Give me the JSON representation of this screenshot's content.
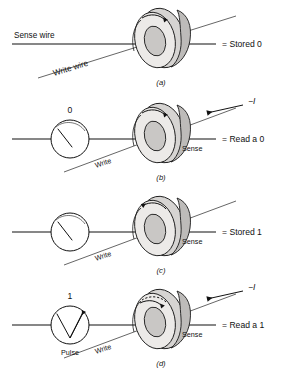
{
  "figure": {
    "background_color": "#ffffff",
    "line_color": "#111111",
    "core_fill": "#d6d4d2",
    "core_shadow": "#bdbbb9"
  },
  "panels": [
    {
      "id": "a",
      "caption": "(a)",
      "result_label": "= Stored 0",
      "sense_wire_label": "Sense wire",
      "write_wire_label": "Write wire",
      "sense_label": "",
      "write_label": "",
      "current_label": "",
      "gauge": null,
      "flux_direction": "clockwise"
    },
    {
      "id": "b",
      "caption": "(b)",
      "result_label": "= Read a 0",
      "sense_wire_label": "",
      "write_wire_label": "",
      "sense_label": "Sense",
      "write_label": "Write",
      "current_label": "−I",
      "gauge": {
        "value_label": "0",
        "bottom_label": "",
        "needle": "flat"
      },
      "flux_direction": "clockwise"
    },
    {
      "id": "c",
      "caption": "(c)",
      "result_label": "= Stored 1",
      "sense_wire_label": "",
      "write_wire_label": "",
      "sense_label": "Sense",
      "write_label": "Write",
      "current_label": "",
      "gauge": {
        "value_label": "",
        "bottom_label": "",
        "needle": "flat"
      },
      "flux_direction": "counterclockwise"
    },
    {
      "id": "d",
      "caption": "(d)",
      "result_label": "= Read a 1",
      "sense_wire_label": "",
      "write_wire_label": "",
      "sense_label": "Sense",
      "write_label": "Write",
      "current_label": "−I",
      "gauge": {
        "value_label": "1",
        "bottom_label": "Pulse",
        "needle": "pulse"
      },
      "flux_direction": "switching"
    }
  ]
}
